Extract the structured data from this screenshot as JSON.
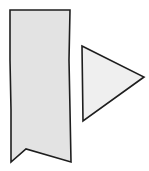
{
  "diagram": {
    "background": "#ffffff",
    "stroke_color": "#1e1e1e",
    "shapes": [
      {
        "name": "bookmark-banner",
        "type": "polygon",
        "fill": "#e3e3e3",
        "points": "10,10 70,10 69,60 70,110 71,162 26,149 11,162 11,110 10,60"
      },
      {
        "name": "play-triangle",
        "type": "polygon",
        "fill": "#efefef",
        "points": "82,46 144,77 83,121"
      }
    ]
  }
}
